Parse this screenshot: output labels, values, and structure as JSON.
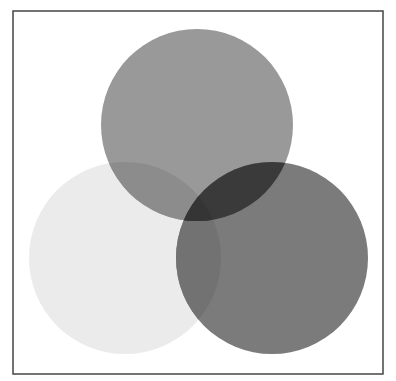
{
  "diagram": {
    "type": "venn",
    "frame": {
      "x": 13,
      "y": 11,
      "width": 370,
      "height": 363,
      "stroke": "#444444",
      "stroke_width": 1.5
    },
    "circles": [
      {
        "id": "top",
        "cx": 197,
        "cy": 125,
        "r": 96,
        "color": "#999999"
      },
      {
        "id": "left",
        "cx": 125,
        "cy": 258,
        "r": 96,
        "color": "#ebebeb"
      },
      {
        "id": "right",
        "cx": 272,
        "cy": 258,
        "r": 96,
        "color": "#7b7b7b"
      }
    ],
    "overlaps": {
      "top_left": "#8c8c8c",
      "top_right": "#3a3a3a",
      "left_right": "#727272",
      "all_three": "#353535"
    }
  }
}
